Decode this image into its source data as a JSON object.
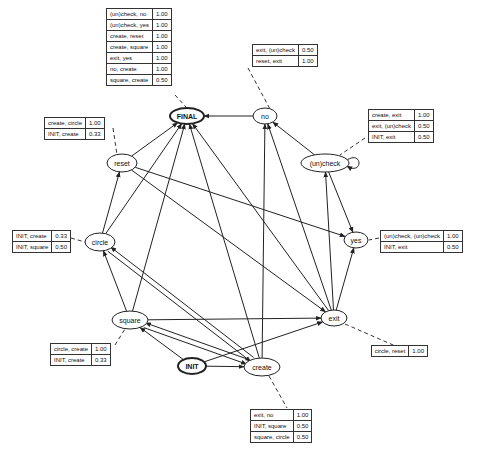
{
  "diagram": {
    "type": "state transition graph",
    "nodes": [
      {
        "id": "FINAL",
        "label": "FINAL",
        "x": 187,
        "y": 116,
        "rx": 17,
        "ry": 8,
        "bold": true
      },
      {
        "id": "no",
        "label": "no",
        "x": 265,
        "y": 116,
        "rx": 12,
        "ry": 8,
        "bold": false
      },
      {
        "id": "uncheck",
        "label": "(un)check",
        "x": 325,
        "y": 163,
        "rx": 24,
        "ry": 9,
        "bold": false
      },
      {
        "id": "yes",
        "label": "yes",
        "x": 356,
        "y": 240,
        "rx": 12,
        "ry": 8,
        "bold": false
      },
      {
        "id": "exit",
        "label": "exit",
        "x": 334,
        "y": 318,
        "rx": 13,
        "ry": 8,
        "bold": false
      },
      {
        "id": "create",
        "label": "create",
        "x": 262,
        "y": 367,
        "rx": 18,
        "ry": 9,
        "bold": false
      },
      {
        "id": "INIT",
        "label": "INIT",
        "x": 192,
        "y": 366,
        "rx": 14,
        "ry": 8,
        "bold": true
      },
      {
        "id": "square",
        "label": "square",
        "x": 130,
        "y": 320,
        "rx": 18,
        "ry": 9,
        "bold": false
      },
      {
        "id": "circle",
        "label": "circle",
        "x": 100,
        "y": 242,
        "rx": 15,
        "ry": 9,
        "bold": false
      },
      {
        "id": "reset",
        "label": "reset",
        "x": 122,
        "y": 163,
        "rx": 15,
        "ry": 9,
        "bold": false
      }
    ],
    "edges": [
      [
        "no",
        "FINAL"
      ],
      [
        "reset",
        "FINAL"
      ],
      [
        "circle",
        "FINAL"
      ],
      [
        "square",
        "FINAL"
      ],
      [
        "create",
        "FINAL"
      ],
      [
        "exit",
        "FINAL"
      ],
      [
        "uncheck",
        "no"
      ],
      [
        "exit",
        "no"
      ],
      [
        "create",
        "no"
      ],
      [
        "uncheck",
        "uncheck"
      ],
      [
        "uncheck",
        "yes"
      ],
      [
        "exit",
        "uncheck"
      ],
      [
        "reset",
        "yes"
      ],
      [
        "exit",
        "yes"
      ],
      [
        "reset",
        "exit"
      ],
      [
        "square",
        "exit"
      ],
      [
        "INIT",
        "exit"
      ],
      [
        "circle",
        "reset"
      ],
      [
        "square",
        "circle"
      ],
      [
        "create",
        "circle"
      ],
      [
        "square",
        "create"
      ],
      [
        "create",
        "square"
      ],
      [
        "INIT",
        "square"
      ],
      [
        "INIT",
        "create"
      ],
      [
        "circle",
        "create"
      ]
    ],
    "tables": [
      {
        "node": "FINAL",
        "x": 106,
        "y": 8,
        "rows": [
          {
            "label": "(un)check, no",
            "value": "1.00"
          },
          {
            "label": "(un)check, yes",
            "value": "1.00"
          },
          {
            "label": "create, reset",
            "value": "1.00"
          },
          {
            "label": "create, square",
            "value": "1.00"
          },
          {
            "label": "exit, yes",
            "value": "1.00"
          },
          {
            "label": "no, create",
            "value": "1.00"
          },
          {
            "label": "square, create",
            "value": "0.50"
          }
        ]
      },
      {
        "node": "no",
        "x": 252,
        "y": 44,
        "rows": [
          {
            "label": "exit, (un)check",
            "value": "0.50"
          },
          {
            "label": "reset, exit",
            "value": "1.00"
          }
        ]
      },
      {
        "node": "uncheck",
        "x": 368,
        "y": 109,
        "rows": [
          {
            "label": "create, exit",
            "value": "1.00"
          },
          {
            "label": "exit, (un)check",
            "value": "0.50"
          },
          {
            "label": "INIT, exit",
            "value": "0.50"
          }
        ]
      },
      {
        "node": "yes",
        "x": 380,
        "y": 230,
        "rows": [
          {
            "label": "(un)check, (un)check",
            "value": "1.00"
          },
          {
            "label": "INIT, exit",
            "value": "0.50"
          }
        ]
      },
      {
        "node": "reset",
        "x": 44,
        "y": 117,
        "rows": [
          {
            "label": "create, circle",
            "value": "1.00"
          },
          {
            "label": "INIT, create",
            "value": "0.33"
          }
        ]
      },
      {
        "node": "circle",
        "x": 12,
        "y": 230,
        "rows": [
          {
            "label": "INIT, create",
            "value": "0.33"
          },
          {
            "label": "INIT, square",
            "value": "0.50"
          }
        ]
      },
      {
        "node": "square",
        "x": 50,
        "y": 343,
        "rows": [
          {
            "label": "circle, create",
            "value": "1.00"
          },
          {
            "label": "INIT, create",
            "value": "0.33"
          }
        ]
      },
      {
        "node": "exit",
        "x": 428,
        "y": 345,
        "align": "right",
        "rows": [
          {
            "label": "circle, reset",
            "value": "1.00"
          }
        ]
      },
      {
        "node": "create",
        "x": 250,
        "y": 409,
        "rows": [
          {
            "label": "exit, no",
            "value": "1.00"
          },
          {
            "label": "INIT, square",
            "value": "0.50"
          },
          {
            "label": "square, circle",
            "value": "0.50"
          }
        ]
      }
    ],
    "leaders": [
      {
        "from": [
          175,
          95
        ],
        "to": [
          186,
          107
        ]
      },
      {
        "from": [
          248,
          68
        ],
        "to": [
          270,
          109
        ]
      },
      {
        "from": [
          365,
          138
        ],
        "to": [
          340,
          155
        ]
      },
      {
        "from": [
          379,
          238
        ],
        "to": [
          369,
          240
        ]
      },
      {
        "from": [
          113,
          128
        ],
        "to": [
          117,
          155
        ]
      },
      {
        "from": [
          71,
          238
        ],
        "to": [
          85,
          242
        ]
      },
      {
        "from": [
          115,
          345
        ],
        "to": [
          125,
          329
        ]
      },
      {
        "from": [
          345,
          324
        ],
        "to": [
          400,
          348
        ]
      },
      {
        "from": [
          269,
          376
        ],
        "to": [
          287,
          408
        ]
      }
    ]
  }
}
